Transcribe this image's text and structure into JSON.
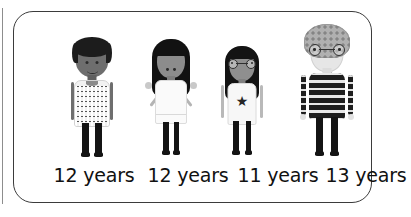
{
  "card": {
    "border_color": "#3b3b3b",
    "background": "#ffffff"
  },
  "people": [
    {
      "id": "person-1",
      "label": "12 years",
      "description": "boy with short black hair and patterned tee",
      "skin": "#6e6e6e",
      "hair": "#1c1c1c",
      "top": "#f2f2f2",
      "bottom": "#141414",
      "glasses": "no",
      "pose": "arms-down"
    },
    {
      "id": "person-2",
      "label": "12 years",
      "description": "girl with long straight black hair and white dress",
      "skin": "#8c8c8c",
      "hair": "#121212",
      "top": "#fafafa",
      "bottom": "#141414",
      "glasses": "no",
      "pose": "arms-out-shrug"
    },
    {
      "id": "person-3",
      "label": "11 years",
      "description": "girl with long black hair, round glasses and star tee",
      "skin": "#8f8f8f",
      "hair": "#131313",
      "top": "#f7f7f7",
      "bottom": "#141414",
      "glasses": "yes",
      "pose": "arms-down",
      "shirt_motif": "star"
    },
    {
      "id": "person-4",
      "label": "13 years",
      "description": "boy with curly light hair, round glasses and striped jumper",
      "skin": "#e6e6e6",
      "hair": "#b0b0b0",
      "top": "#1e1e1e",
      "bottom": "#141414",
      "glasses": "yes",
      "pose": "arms-down",
      "shirt_motif": "horizontal-stripes"
    }
  ],
  "icons": {
    "star": "★"
  }
}
